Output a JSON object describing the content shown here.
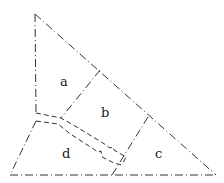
{
  "diagram": {
    "type": "land-parcel-subdivision",
    "regions": [
      {
        "id": "a",
        "label": "a"
      },
      {
        "id": "b",
        "label": "b"
      },
      {
        "id": "c",
        "label": "c"
      },
      {
        "id": "d",
        "label": "d"
      }
    ],
    "line_color": "#333333",
    "background": "#ffffff"
  }
}
